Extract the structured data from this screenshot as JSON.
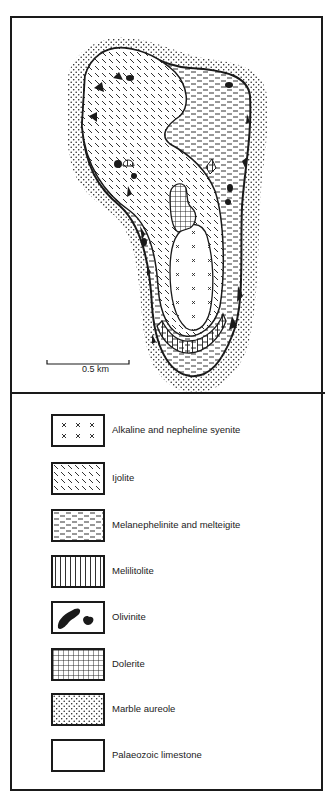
{
  "map": {
    "scale_bar_label": "0.5 km"
  },
  "legend": {
    "items": [
      {
        "label": "Alkaline and nepheline syenite",
        "pattern": "crosses"
      },
      {
        "label": "Ijolite",
        "pattern": "diagonal-dashes"
      },
      {
        "label": "Melanephelinite and melteigite",
        "pattern": "horizontal-dashes"
      },
      {
        "label": "Melilitolite",
        "pattern": "vertical-lines"
      },
      {
        "label": "Olivinite",
        "pattern": "solid-black-blobs"
      },
      {
        "label": "Dolerite",
        "pattern": "grid"
      },
      {
        "label": "Marble aureole",
        "pattern": "stipple-dots"
      },
      {
        "label": "Palaeozoic limestone",
        "pattern": "blank"
      }
    ]
  },
  "colors": {
    "ink": "#1a1a1a",
    "paper": "#ffffff"
  }
}
